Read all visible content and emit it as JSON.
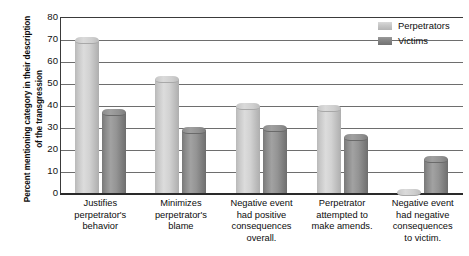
{
  "chart_data": {
    "type": "bar",
    "title": "",
    "xlabel": "",
    "ylabel": "Percent mentioning category in their description of the transgression",
    "ylim": [
      0,
      80
    ],
    "ytick_step": 10,
    "yticks": [
      80,
      70,
      60,
      50,
      40,
      30,
      20,
      10,
      0
    ],
    "grid": true,
    "legend_position": "top-right",
    "categories": [
      "Justifies perpetrator's behavior",
      "Minimizes perpetrator's blame",
      "Negative event had positive consequences overall.",
      "Perpetrator attempted to make amends.",
      "Negative event had negative consequences to victim."
    ],
    "category_lines": [
      [
        "Justifies",
        "perpetrator's",
        "behavior"
      ],
      [
        "Minimizes",
        "perpetrator's",
        "blame"
      ],
      [
        "Negative event",
        "had positive",
        "consequences",
        "overall."
      ],
      [
        "Perpetrator",
        "attempted to",
        "make amends."
      ],
      [
        "Negative event",
        "had negative",
        "consequences",
        "to victim."
      ]
    ],
    "series": [
      {
        "name": "Perpetrators",
        "color": "#cccccc",
        "values": [
          71,
          53,
          41,
          40,
          2
        ]
      },
      {
        "name": "Victims",
        "color": "#8a8a8a",
        "values": [
          38,
          30,
          31,
          27,
          17
        ]
      }
    ]
  },
  "axis": {
    "y_title": "Percent mentioning category in their description of the transgression"
  },
  "legend": {
    "items": [
      {
        "label": "Perpetrators",
        "swatch": "perp"
      },
      {
        "label": "Victims",
        "swatch": "vict"
      }
    ]
  }
}
